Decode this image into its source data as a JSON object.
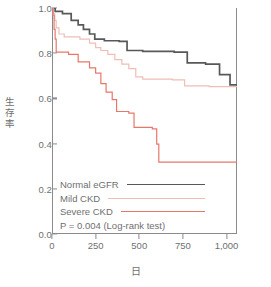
{
  "chart_data": {
    "type": "line",
    "subtype": "kaplan-meier-step",
    "title": "",
    "xlabel": "日",
    "ylabel": "生存率",
    "xlim": [
      0,
      1060
    ],
    "ylim": [
      0.0,
      1.0
    ],
    "grid": false,
    "x_ticks": [
      0,
      250,
      500,
      750,
      1000
    ],
    "x_tick_labels": [
      "0",
      "250",
      "500",
      "750",
      "1,000"
    ],
    "y_ticks": [
      0.0,
      0.2,
      0.4,
      0.6,
      0.8,
      1.0
    ],
    "y_tick_labels": [
      "0.0",
      "0.2",
      "0.4",
      "0.6",
      "0.8",
      "1.0"
    ],
    "legend_position": "lower-left",
    "annotation": "P = 0.004  (Log-rank test)",
    "series": [
      {
        "name": "Normal eGFR",
        "color": "#57585a",
        "points": [
          [
            0,
            1.0
          ],
          [
            18,
            1.0
          ],
          [
            18,
            0.985
          ],
          [
            60,
            0.985
          ],
          [
            60,
            0.975
          ],
          [
            110,
            0.975
          ],
          [
            110,
            0.945
          ],
          [
            150,
            0.945
          ],
          [
            150,
            0.925
          ],
          [
            180,
            0.925
          ],
          [
            180,
            0.905
          ],
          [
            215,
            0.905
          ],
          [
            215,
            0.885
          ],
          [
            245,
            0.885
          ],
          [
            245,
            0.862
          ],
          [
            300,
            0.862
          ],
          [
            300,
            0.855
          ],
          [
            385,
            0.855
          ],
          [
            385,
            0.852
          ],
          [
            430,
            0.852
          ],
          [
            430,
            0.812
          ],
          [
            520,
            0.812
          ],
          [
            520,
            0.808
          ],
          [
            700,
            0.808
          ],
          [
            700,
            0.805
          ],
          [
            775,
            0.805
          ],
          [
            775,
            0.757
          ],
          [
            880,
            0.757
          ],
          [
            880,
            0.752
          ],
          [
            960,
            0.752
          ],
          [
            960,
            0.705
          ],
          [
            1020,
            0.705
          ],
          [
            1020,
            0.66
          ],
          [
            1060,
            0.66
          ]
        ]
      },
      {
        "name": "Mild CKD",
        "color": "#f0beb6",
        "points": [
          [
            0,
            1.0
          ],
          [
            8,
            1.0
          ],
          [
            8,
            0.975
          ],
          [
            16,
            0.975
          ],
          [
            16,
            0.945
          ],
          [
            24,
            0.945
          ],
          [
            24,
            0.912
          ],
          [
            40,
            0.912
          ],
          [
            40,
            0.885
          ],
          [
            70,
            0.885
          ],
          [
            70,
            0.872
          ],
          [
            160,
            0.872
          ],
          [
            160,
            0.862
          ],
          [
            215,
            0.862
          ],
          [
            215,
            0.845
          ],
          [
            250,
            0.845
          ],
          [
            250,
            0.825
          ],
          [
            280,
            0.825
          ],
          [
            280,
            0.812
          ],
          [
            320,
            0.812
          ],
          [
            320,
            0.795
          ],
          [
            360,
            0.795
          ],
          [
            360,
            0.772
          ],
          [
            400,
            0.772
          ],
          [
            400,
            0.752
          ],
          [
            440,
            0.752
          ],
          [
            440,
            0.732
          ],
          [
            480,
            0.732
          ],
          [
            480,
            0.695
          ],
          [
            520,
            0.695
          ],
          [
            520,
            0.685
          ],
          [
            690,
            0.685
          ],
          [
            690,
            0.682
          ],
          [
            760,
            0.682
          ],
          [
            760,
            0.655
          ],
          [
            900,
            0.655
          ],
          [
            900,
            0.652
          ],
          [
            1060,
            0.652
          ]
        ]
      },
      {
        "name": "Severe CKD",
        "color": "#e6786a",
        "points": [
          [
            0,
            1.0
          ],
          [
            6,
            1.0
          ],
          [
            6,
            0.968
          ],
          [
            12,
            0.968
          ],
          [
            12,
            0.905
          ],
          [
            18,
            0.905
          ],
          [
            18,
            0.862
          ],
          [
            24,
            0.862
          ],
          [
            24,
            0.805
          ],
          [
            95,
            0.805
          ],
          [
            95,
            0.795
          ],
          [
            150,
            0.795
          ],
          [
            150,
            0.762
          ],
          [
            215,
            0.762
          ],
          [
            215,
            0.735
          ],
          [
            250,
            0.735
          ],
          [
            250,
            0.712
          ],
          [
            280,
            0.712
          ],
          [
            280,
            0.665
          ],
          [
            310,
            0.665
          ],
          [
            310,
            0.628
          ],
          [
            345,
            0.628
          ],
          [
            345,
            0.595
          ],
          [
            370,
            0.595
          ],
          [
            370,
            0.542
          ],
          [
            440,
            0.542
          ],
          [
            440,
            0.535
          ],
          [
            470,
            0.535
          ],
          [
            470,
            0.472
          ],
          [
            575,
            0.472
          ],
          [
            575,
            0.465
          ],
          [
            600,
            0.465
          ],
          [
            600,
            0.398
          ],
          [
            612,
            0.398
          ],
          [
            612,
            0.318
          ],
          [
            1060,
            0.318
          ]
        ]
      }
    ]
  },
  "legend": {
    "items": [
      {
        "label": "Normal eGFR",
        "color": "#57585a",
        "width": 1.7
      },
      {
        "label": "Mild CKD",
        "color": "#f0beb6",
        "width": 1.3
      },
      {
        "label": "Severe CKD",
        "color": "#e6786a",
        "width": 1.3
      }
    ],
    "pvalue_text": "P = 0.004  (Log-rank test)"
  },
  "axes": {
    "y_title_chars": [
      "生",
      "存",
      "率"
    ],
    "x_title": "日"
  }
}
